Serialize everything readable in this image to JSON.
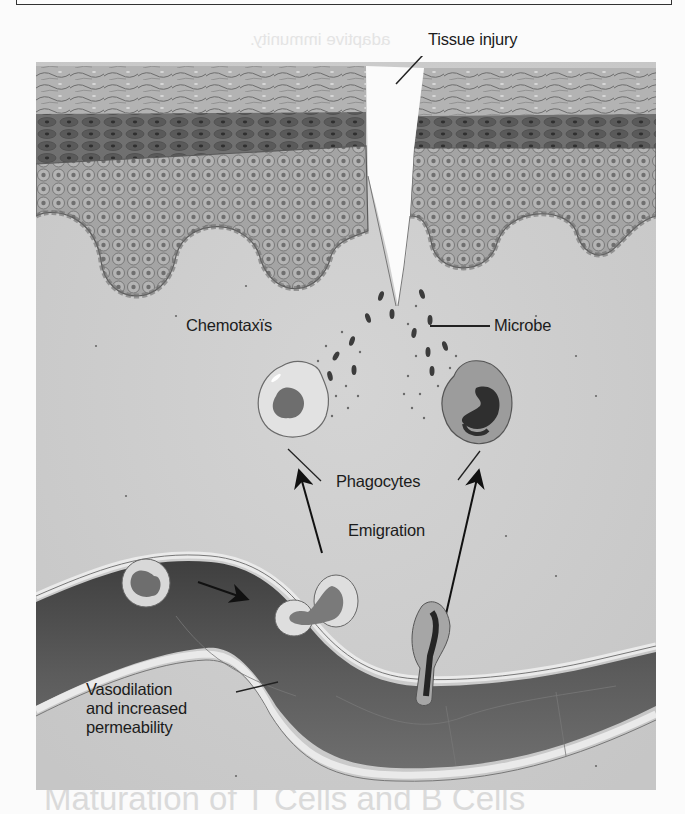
{
  "figure": {
    "labels": {
      "tissue_injury": "Tissue injury",
      "chemotaxis": "Chemotaxïs",
      "microbe": "Microbe",
      "phagocytes": "Phagocytes",
      "emigration": "Emigration",
      "vasodilation_line1": "Vasodilation",
      "vasodilation_line2": "and increased",
      "vasodilation_line3": "permeability"
    },
    "structures": [
      "epidermis-left",
      "epidermis-right",
      "wound-gap",
      "dermis",
      "microbes",
      "phagocyte-left",
      "phagocyte-right",
      "blood-vessel",
      "leukocyte-in-vessel",
      "leukocyte-squeezing-through-wall",
      "leukocyte-emigrating"
    ],
    "colors": {
      "dermis": "#cfcfcf",
      "stratum_corneum": "#a9a9a9",
      "dark_layer": "#5f5f5f",
      "cell_layer": "#9a9a9a",
      "vessel_lumen": "#4a4a4a",
      "label_text": "#1c1c1c"
    }
  },
  "bleed_through": {
    "lines": [
      "adaptive immunity.",
      "Explain the relationship between an antigen and an"
    ],
    "bottom_heading": "Maturation of T Cells and B Cells"
  }
}
